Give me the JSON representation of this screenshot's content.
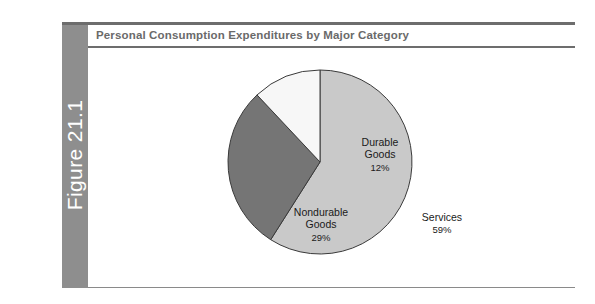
{
  "figure": {
    "number_label": "Figure 21.1",
    "title": "Personal Consumption Expenditures by Major Category"
  },
  "colors": {
    "tab_background": "#8e8e8e",
    "tab_text": "#ffffff",
    "title_text": "#6a6a6a",
    "rule": "#6d6d6d",
    "page_background": "#ffffff",
    "slice_outline": "#3a3a3a",
    "services": "#c9c9c9",
    "nondurable_goods": "#757575",
    "durable_goods": "#f7f7f7"
  },
  "chart_data": {
    "type": "pie",
    "title": "Personal Consumption Expenditures by Major Category",
    "xlabel": "",
    "ylabel": "",
    "legend": "none",
    "labels_inside_slices": true,
    "start_angle_deg": 0,
    "direction": "clockwise",
    "categories": [
      "Services",
      "Nondurable Goods",
      "Durable Goods"
    ],
    "values": [
      59,
      29,
      12
    ],
    "value_unit": "%",
    "slices": [
      {
        "label": "Services",
        "label_line1": "Services",
        "value": 59,
        "value_text": "59%",
        "color": "#c9c9c9",
        "start_angle_deg": 0,
        "end_angle_deg": 212.4
      },
      {
        "label": "Nondurable Goods",
        "label_line1": "Nondurable",
        "label_line2": "Goods",
        "value": 29,
        "value_text": "29%",
        "color": "#757575",
        "start_angle_deg": 212.4,
        "end_angle_deg": 316.8
      },
      {
        "label": "Durable Goods",
        "label_line1": "Durable",
        "label_line2": "Goods",
        "value": 12,
        "value_text": "12%",
        "color": "#f7f7f7",
        "start_angle_deg": 316.8,
        "end_angle_deg": 360
      }
    ],
    "total": 100
  }
}
